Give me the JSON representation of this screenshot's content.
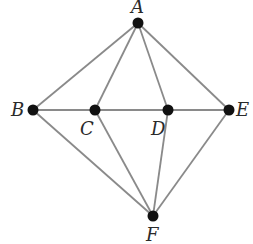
{
  "diagram": {
    "type": "graph",
    "colors": {
      "edge": "#8a8a8a",
      "node": "#111111",
      "label": "#2a2a2a",
      "background": "#ffffff"
    },
    "nodes": [
      {
        "id": "A",
        "label": "A",
        "x": 138,
        "y": 23,
        "label_x": 131,
        "label_y": 13
      },
      {
        "id": "B",
        "label": "B",
        "x": 33,
        "y": 110,
        "label_x": 11,
        "label_y": 116
      },
      {
        "id": "C",
        "label": "C",
        "x": 95,
        "y": 110,
        "label_x": 80,
        "label_y": 135
      },
      {
        "id": "D",
        "label": "D",
        "x": 168,
        "y": 110,
        "label_x": 151,
        "label_y": 135
      },
      {
        "id": "E",
        "label": "E",
        "x": 229,
        "y": 110,
        "label_x": 236,
        "label_y": 116
      },
      {
        "id": "F",
        "label": "F",
        "x": 153,
        "y": 216,
        "label_x": 146,
        "label_y": 241
      }
    ],
    "edges": [
      [
        "A",
        "B"
      ],
      [
        "A",
        "C"
      ],
      [
        "A",
        "D"
      ],
      [
        "A",
        "E"
      ],
      [
        "B",
        "C"
      ],
      [
        "C",
        "D"
      ],
      [
        "D",
        "E"
      ],
      [
        "B",
        "F"
      ],
      [
        "C",
        "F"
      ],
      [
        "D",
        "F"
      ],
      [
        "E",
        "F"
      ]
    ]
  }
}
